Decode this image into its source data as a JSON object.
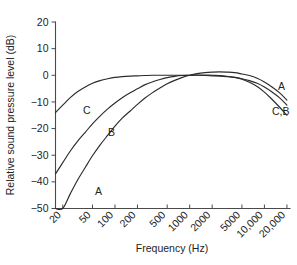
{
  "chart_data": {
    "type": "line",
    "title": "",
    "xlabel": "Frequency (Hz)",
    "ylabel": "Relative sound pressure level (dB)",
    "xscale": "log",
    "xlim": [
      16,
      22000
    ],
    "ylim": [
      -50,
      20
    ],
    "yticks": [
      20,
      10,
      0,
      -10,
      -20,
      -30,
      -40,
      -50
    ],
    "ytick_labels": [
      "20",
      "10",
      "0",
      "−10",
      "−20",
      "−30",
      "−40",
      "−50"
    ],
    "xticks": [
      20,
      50,
      100,
      200,
      500,
      1000,
      2000,
      5000,
      10000,
      20000
    ],
    "xtick_labels": [
      "20",
      "50",
      "100",
      "200",
      "500",
      "1000",
      "2000",
      "5000",
      "10,000",
      "20,000"
    ],
    "grid": false,
    "legend": "inline-curve-labels",
    "series": [
      {
        "name": "A",
        "label": "A",
        "left_label": "A",
        "right_label": "A",
        "x": [
          16,
          20,
          25,
          31.5,
          40,
          50,
          63,
          80,
          100,
          125,
          160,
          200,
          250,
          315,
          400,
          500,
          630,
          800,
          1000,
          1250,
          1600,
          2000,
          2500,
          3150,
          4000,
          5000,
          6300,
          8000,
          10000,
          12500,
          16000,
          20000
        ],
        "y": [
          -56.7,
          -50.5,
          -44.7,
          -39.4,
          -34.6,
          -30.2,
          -26.2,
          -22.5,
          -19.1,
          -16.1,
          -13.4,
          -10.9,
          -8.6,
          -6.6,
          -4.8,
          -3.2,
          -1.9,
          -0.8,
          0.0,
          0.6,
          1.0,
          1.2,
          1.3,
          1.2,
          1.0,
          0.5,
          -0.1,
          -1.1,
          -2.5,
          -4.3,
          -6.6,
          -9.3
        ]
      },
      {
        "name": "B",
        "label": "B",
        "left_label": "B",
        "right_label": "C,B",
        "x": [
          16,
          20,
          25,
          31.5,
          40,
          50,
          63,
          80,
          100,
          125,
          160,
          200,
          250,
          315,
          400,
          500,
          630,
          800,
          1000,
          1250,
          1600,
          2000,
          2500,
          3150,
          4000,
          5000,
          6300,
          8000,
          10000,
          12500,
          16000,
          20000
        ],
        "y": [
          -37.0,
          -32.8,
          -28.6,
          -24.8,
          -21.4,
          -18.2,
          -15.3,
          -12.6,
          -10.4,
          -8.4,
          -6.6,
          -5.1,
          -3.6,
          -2.5,
          -1.6,
          -0.9,
          -0.4,
          -0.1,
          0.0,
          0.1,
          0.1,
          0.0,
          -0.1,
          -0.4,
          -0.8,
          -1.5,
          -2.6,
          -4.2,
          -6.3,
          -8.9,
          -12.0,
          -15.0
        ]
      },
      {
        "name": "C",
        "label": "C",
        "left_label": "C",
        "right_label": "C,B",
        "x": [
          16,
          20,
          25,
          31.5,
          40,
          50,
          63,
          80,
          100,
          125,
          160,
          200,
          250,
          315,
          400,
          500,
          630,
          800,
          1000,
          1250,
          1600,
          2000,
          2500,
          3150,
          4000,
          5000,
          6300,
          8000,
          10000,
          12500,
          16000,
          20000
        ],
        "y": [
          -14.0,
          -11.2,
          -8.5,
          -6.2,
          -4.4,
          -3.0,
          -2.0,
          -1.3,
          -0.8,
          -0.5,
          -0.3,
          -0.2,
          -0.1,
          0.0,
          0.0,
          0.0,
          0.0,
          0.0,
          0.0,
          0.0,
          -0.1,
          -0.2,
          -0.3,
          -0.5,
          -0.8,
          -1.3,
          -2.0,
          -3.0,
          -4.4,
          -6.2,
          -8.5,
          -11.2
        ]
      }
    ],
    "annotations": [
      {
        "text": "C",
        "x": 42,
        "y": -13.0,
        "role": "curve-label-left-c"
      },
      {
        "text": "B",
        "x": 90,
        "y": -21.5,
        "role": "curve-label-left-b"
      },
      {
        "text": "A",
        "x": 60,
        "y": -43.5,
        "role": "curve-label-left-a"
      },
      {
        "text": "A",
        "x": 17000,
        "y": -4.0,
        "role": "curve-label-right-a"
      },
      {
        "text": "C,B",
        "x": 16500,
        "y": -13.5,
        "role": "curve-label-right-cb"
      }
    ]
  }
}
